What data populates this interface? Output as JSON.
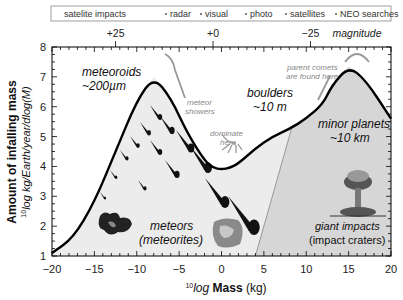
{
  "legend_bar": {
    "items": [
      "satelite impacts",
      "radar",
      "visual",
      "photo",
      "satellites",
      "NEO searches"
    ]
  },
  "magnitude_axis": {
    "ticks": [
      "+25",
      "+0",
      "−25"
    ],
    "label": "magnitude"
  },
  "labels": {
    "meteoroids": "meteoroids",
    "meteoroids_size": "~200µm",
    "boulders": "boulders",
    "boulders_size": "~10 m",
    "minor_planets": "minor planets",
    "minor_planets_size": "~10 km",
    "meteors": "meteors",
    "meteorites": "(meteorites)",
    "giant_impacts": "giant impacts",
    "impact_craters": "(impact craters)",
    "meteor_showers_1": "meteor",
    "meteor_showers_2": "showers",
    "dominate_1": "dominate",
    "dominate_2": "here",
    "parent_comets_1": "parent comets",
    "parent_comets_2": "are found here"
  },
  "chart_data": {
    "type": "line",
    "title": "",
    "xlabel": "10log Mass (kg)",
    "ylabel": "Amount of infalling mass 10log kg/Earth/year/dlog(M)",
    "xlim": [
      -20,
      20
    ],
    "ylim": [
      1,
      8
    ],
    "x_ticks": [
      -20,
      -15,
      -10,
      -5,
      0,
      5,
      10,
      15,
      20
    ],
    "y_ticks": [
      1,
      2,
      3,
      4,
      5,
      6,
      7,
      8
    ],
    "series": [
      {
        "name": "infalling mass",
        "x": [
          -20,
          -17.5,
          -15,
          -12.5,
          -10,
          -8,
          -6,
          -4,
          -2,
          -1,
          0,
          1,
          2,
          4,
          6,
          8,
          10,
          12,
          13,
          15,
          17,
          20
        ],
        "values": [
          1.1,
          1.6,
          2.8,
          4.5,
          6.2,
          7.0,
          6.3,
          5.1,
          4.2,
          3.95,
          3.9,
          3.95,
          4.1,
          4.6,
          5.0,
          5.25,
          5.6,
          6.1,
          6.7,
          7.35,
          6.9,
          5.6
        ]
      }
    ],
    "regions": [
      {
        "name": "meteors (meteorites)",
        "x_range": [
          -20,
          4
        ]
      },
      {
        "name": "giant impacts (impact craters)",
        "x_range": [
          4,
          20
        ]
      }
    ],
    "secondary_axis": {
      "label": "magnitude",
      "ticks": [
        {
          "value": "+25",
          "x": -12.5
        },
        {
          "value": "+0",
          "x": -1
        },
        {
          "value": "-25",
          "x": 10.5
        }
      ]
    },
    "legend_position": "top"
  }
}
